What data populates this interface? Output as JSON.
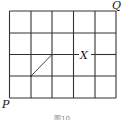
{
  "diagram": {
    "grid": {
      "columns": 5,
      "rows": 4
    },
    "points": {
      "P": {
        "label": "P",
        "position": "bottom-left corner"
      },
      "Q": {
        "label": "Q",
        "position": "top-right corner"
      },
      "X": {
        "label": "X",
        "position": "on third horizontal line from top, between 4th and 5th vertical lines"
      }
    },
    "diagonal_segment": {
      "from": "grid node (1,1) from bottom-left",
      "to": "grid node (2,2) from bottom-left"
    },
    "caption": "图10",
    "colors": {
      "line": "#333333",
      "background": "#ffffff"
    }
  }
}
